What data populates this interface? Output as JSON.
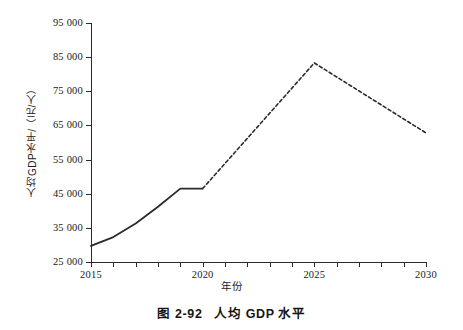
{
  "figure": {
    "caption_number": "图 2-92",
    "caption_title": "人均 GDP 水平",
    "background_color": "#ffffff",
    "ink_color": "#2b2b2b"
  },
  "chart_data": {
    "type": "line",
    "title": "人均 GDP 水平",
    "xlabel": "年份",
    "ylabel": "人均GDP水平/（元/人）",
    "xlim": [
      2015,
      2030
    ],
    "ylim": [
      25000,
      95000
    ],
    "grid": false,
    "legend": "none",
    "x_tick_labels": [
      "2015",
      "2020",
      "2025",
      "2030"
    ],
    "x_tick_values": [
      2015,
      2020,
      2025,
      2030
    ],
    "x_minor_ticks": [
      2015,
      2016,
      2017,
      2018,
      2019,
      2020,
      2021,
      2022,
      2023,
      2024,
      2025,
      2026,
      2027,
      2028,
      2029,
      2030
    ],
    "y_tick_labels": [
      "25 000",
      "35 000",
      "45 000",
      "55 000",
      "65 000",
      "75 000",
      "85 000",
      "95 000"
    ],
    "y_tick_values": [
      25000,
      35000,
      45000,
      55000,
      65000,
      75000,
      85000,
      95000
    ],
    "series": [
      {
        "name": "历史值",
        "style": "solid",
        "color": "#2b2b2b",
        "x": [
          2015,
          2016,
          2017,
          2018,
          2019,
          2020
        ],
        "values": [
          29700,
          32300,
          36300,
          41200,
          46500,
          46500
        ]
      },
      {
        "name": "预测值",
        "style": "dashed",
        "color": "#2b2b2b",
        "x": [
          2020,
          2025,
          2030
        ],
        "values": [
          46500,
          83300,
          62800
        ]
      }
    ]
  }
}
